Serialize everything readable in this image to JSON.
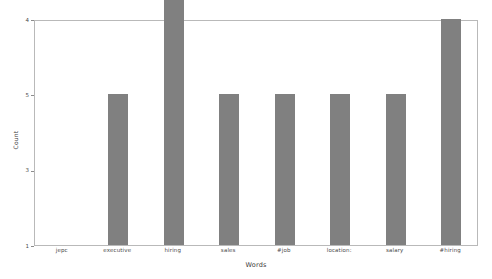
{
  "chart_data": {
    "type": "bar",
    "title": "",
    "xlabel": "Words",
    "ylabel": "Count",
    "categories": [
      "jepc",
      "executive",
      "hiring",
      "sales",
      "#job",
      "location:",
      "salary",
      "#hiring"
    ],
    "values": [
      1,
      3,
      5,
      3,
      3,
      3,
      3,
      4
    ],
    "yticks": [
      1,
      3,
      5,
      4
    ],
    "ytick_positions": [
      1,
      2,
      3,
      4
    ],
    "ylim": [
      1,
      4
    ],
    "grid": false,
    "legend": null,
    "bar_color": "#808080",
    "background_color": "#ffffff",
    "frame_color": "#b9b9b9"
  },
  "axes": {
    "y_title": "Count",
    "x_title": "Words",
    "y_tick_labels": [
      "4",
      "5",
      "3",
      "1"
    ],
    "x_tick_labels": [
      "jepc",
      "executive",
      "hiring",
      "sales",
      "#job",
      "location:",
      "salary",
      "#hiring"
    ]
  }
}
